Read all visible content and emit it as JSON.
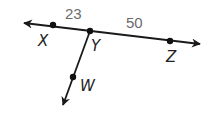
{
  "diagram": {
    "type": "geometry-lines",
    "colors": {
      "line": "#1a1a1a",
      "point": "#111111",
      "point_label": "#222222",
      "length_label": "#6b6b6b",
      "background": "#ffffff"
    },
    "line_xz": {
      "description": "Line through X, Y, Z with arrows at both ends",
      "arrow_left": {
        "x": 24,
        "y": 23
      },
      "arrow_right": {
        "x": 200,
        "y": 44
      }
    },
    "ray_yw": {
      "description": "Ray from Y through W",
      "arrow_end": {
        "x": 63,
        "y": 105
      }
    },
    "points": [
      {
        "name": "X",
        "x": 53,
        "y": 25,
        "label": "X",
        "label_x": 38,
        "label_y": 46
      },
      {
        "name": "Y",
        "x": 90,
        "y": 31,
        "label": "Y",
        "label_x": 92,
        "label_y": 51
      },
      {
        "name": "Z",
        "x": 170,
        "y": 41,
        "label": "Z",
        "label_x": 167,
        "label_y": 62
      },
      {
        "name": "W",
        "x": 73,
        "y": 77,
        "label": "W",
        "label_x": 80,
        "label_y": 91
      }
    ],
    "segment_lengths": [
      {
        "segment": "XY",
        "value": "23",
        "x": 65,
        "y": 20
      },
      {
        "segment": "YZ",
        "value": "50",
        "x": 126,
        "y": 28
      }
    ]
  }
}
